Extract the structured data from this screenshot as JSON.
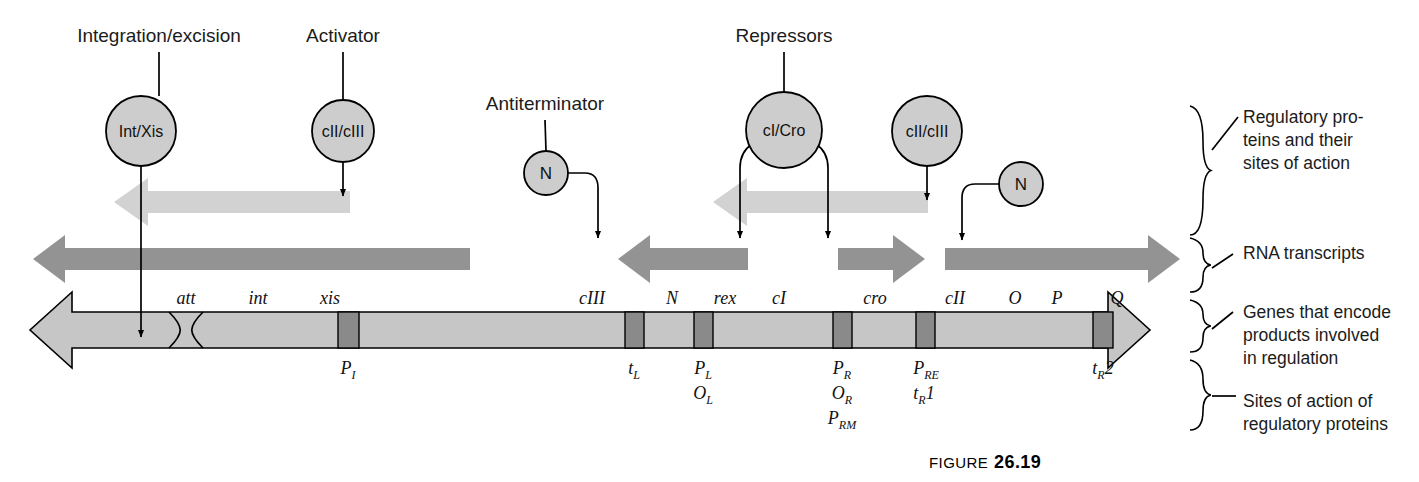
{
  "figure": {
    "caption_prefix": "FIGURE",
    "caption_number": "26.19"
  },
  "colors": {
    "protein_circle_fill": "#cdcdcd",
    "light_arrow": "#d2d2d2",
    "transcript_arrow": "#939393",
    "gene_bar": "#c6c6c6",
    "site_box": "#8a8a8a",
    "stroke": "#000000",
    "text": "#1b1b1b"
  },
  "protein_row": {
    "headings": [
      {
        "text": "Integration/excision",
        "x": 159,
        "y": 42
      },
      {
        "text": "Activator",
        "x": 343,
        "y": 42
      },
      {
        "text": "Antiterminator",
        "x": 545,
        "y": 110
      },
      {
        "text": "Repressors",
        "x": 784,
        "y": 42
      }
    ],
    "circles": [
      {
        "label": "Int/Xis",
        "cx": 141,
        "cy": 131,
        "r": 35,
        "size": "large"
      },
      {
        "label": "cII/cIII",
        "cx": 343,
        "cy": 131,
        "r": 31,
        "size": "large"
      },
      {
        "label": "N",
        "cx": 546,
        "cy": 173,
        "r": 22,
        "size": "small"
      },
      {
        "label": "cI/Cro",
        "cx": 784,
        "cy": 130,
        "r": 38,
        "size": "large"
      },
      {
        "label": "cII/cIII",
        "cx": 927,
        "cy": 131,
        "r": 35,
        "size": "large"
      },
      {
        "label": "N",
        "cx": 1021,
        "cy": 184,
        "r": 22,
        "size": "small"
      }
    ]
  },
  "light_arrows": [
    {
      "name": "int-xis-action-arrow",
      "direction": "left",
      "x_start": 350,
      "x_end": 114,
      "y": 202
    },
    {
      "name": "ci-cro-action-arrow",
      "direction": "left",
      "x_start": 928,
      "x_end": 713,
      "y": 202
    }
  ],
  "transcripts": [
    {
      "name": "leftward-long-transcript",
      "direction": "left",
      "x_start": 470,
      "x_end": 33,
      "y": 259
    },
    {
      "name": "leftward-short-transcript",
      "direction": "left",
      "x_start": 748,
      "x_end": 618,
      "y": 259
    },
    {
      "name": "rightward-short-transcript",
      "direction": "right",
      "x_start": 838,
      "x_end": 925,
      "y": 259
    },
    {
      "name": "rightward-long-transcript",
      "direction": "right",
      "x_start": 945,
      "x_end": 1180,
      "y": 259
    }
  ],
  "gene_map": {
    "bar_left": 30,
    "bar_right": 1150,
    "bar_y": 312,
    "bar_height": 36,
    "att_site": {
      "label": "att",
      "x": 186
    },
    "genes": [
      {
        "label": "att",
        "x": 186
      },
      {
        "label": "int",
        "x": 258
      },
      {
        "label": "xis",
        "x": 330
      },
      {
        "label": "cIII",
        "x": 592
      },
      {
        "label": "N",
        "x": 672
      },
      {
        "label": "rex",
        "x": 725
      },
      {
        "label": "cI",
        "x": 779
      },
      {
        "label": "cro",
        "x": 875
      },
      {
        "label": "cII",
        "x": 955
      },
      {
        "label": "O",
        "x": 1015
      },
      {
        "label": "P",
        "x": 1057
      },
      {
        "label": "Q",
        "x": 1117
      }
    ],
    "site_boxes": [
      {
        "name": "P-I",
        "x": 338,
        "w": 21
      },
      {
        "name": "t-L",
        "x": 625,
        "w": 19
      },
      {
        "name": "P-L",
        "x": 694,
        "w": 19
      },
      {
        "name": "P-R",
        "x": 833,
        "w": 19
      },
      {
        "name": "P-RE",
        "x": 916,
        "w": 19
      },
      {
        "name": "t-R2",
        "x": 1093,
        "w": 20
      }
    ],
    "site_labels": [
      {
        "base": "P",
        "sub": "I",
        "x": 348,
        "y": 374,
        "stack": 0
      },
      {
        "base": "t",
        "sub": "L",
        "x": 634,
        "y": 374,
        "stack": 0
      },
      {
        "base": "P",
        "sub": "L",
        "x": 703,
        "y": 374,
        "stack": 0
      },
      {
        "base": "O",
        "sub": "L",
        "x": 703,
        "y": 399,
        "stack": 1
      },
      {
        "base": "P",
        "sub": "R",
        "x": 842,
        "y": 374,
        "stack": 0
      },
      {
        "base": "O",
        "sub": "R",
        "x": 842,
        "y": 399,
        "stack": 1
      },
      {
        "base": "P",
        "sub": "RM",
        "x": 842,
        "y": 424,
        "stack": 2
      },
      {
        "base": "P",
        "sub": "RE",
        "x": 926,
        "y": 374,
        "stack": 0
      },
      {
        "base": "t",
        "sub": "R",
        "suffix": "1",
        "x": 924,
        "y": 399,
        "stack": 1
      },
      {
        "base": "t",
        "sub": "R",
        "suffix": "2",
        "x": 1103,
        "y": 374,
        "stack": 0
      }
    ]
  },
  "bracket_labels": [
    {
      "name": "regulatory-proteins-label",
      "lines": [
        "Regulatory pro-",
        "teins and their",
        "sites of action"
      ],
      "x": 1243,
      "y": 123
    },
    {
      "name": "rna-transcripts-label",
      "lines": [
        "RNA transcripts"
      ],
      "x": 1243,
      "y": 259
    },
    {
      "name": "genes-encode-label",
      "lines": [
        "Genes that encode",
        "products involved",
        "in regulation"
      ],
      "x": 1243,
      "y": 318
    },
    {
      "name": "sites-of-action-label",
      "lines": [
        "Sites of action of",
        "regulatory proteins"
      ],
      "x": 1243,
      "y": 407
    }
  ]
}
